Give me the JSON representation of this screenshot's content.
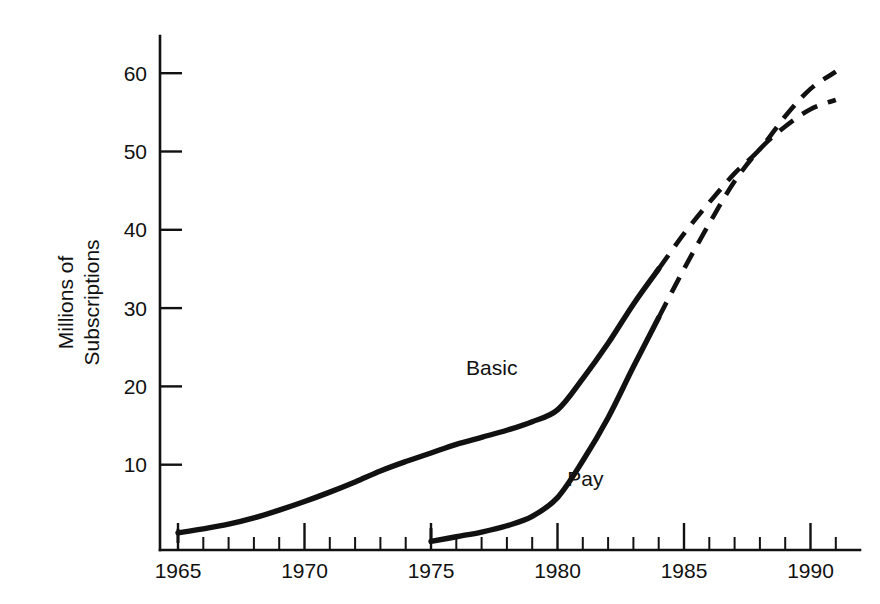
{
  "chart_data": {
    "type": "line",
    "title": "",
    "subtitle": "",
    "xlabel": "",
    "ylabel": "Millions of Subscriptions",
    "ylabel_lines": [
      "Millions of",
      "Subscriptions"
    ],
    "xlim": [
      1965,
      1991
    ],
    "ylim": [
      0,
      64
    ],
    "grid": false,
    "legend_position": "inline-annotations",
    "y_ticks": [
      10,
      20,
      30,
      40,
      50,
      60
    ],
    "y_tick_labels": [
      "10",
      "20",
      "30",
      "40",
      "50",
      "60"
    ],
    "x_ticks_major": [
      1965,
      1970,
      1975,
      1980,
      1985,
      1990
    ],
    "x_tick_labels": [
      "1965",
      "1970",
      "1975",
      "1980",
      "1985",
      "1990"
    ],
    "x_ticks_minor": [
      1966,
      1967,
      1968,
      1969,
      1971,
      1972,
      1973,
      1974,
      1976,
      1977,
      1978,
      1979,
      1981,
      1982,
      1983,
      1984,
      1986,
      1987,
      1988,
      1989,
      1991
    ],
    "series": [
      {
        "name": "Basic",
        "label": "Basic",
        "label_x": 1977.4,
        "label_y": 21.5,
        "style": "solid-then-dashed",
        "actual": [
          {
            "x": 1965,
            "y": 1.3
          },
          {
            "x": 1966,
            "y": 1.8
          },
          {
            "x": 1967,
            "y": 2.4
          },
          {
            "x": 1968,
            "y": 3.2
          },
          {
            "x": 1969,
            "y": 4.2
          },
          {
            "x": 1970,
            "y": 5.3
          },
          {
            "x": 1971,
            "y": 6.5
          },
          {
            "x": 1972,
            "y": 7.8
          },
          {
            "x": 1973,
            "y": 9.2
          },
          {
            "x": 1974,
            "y": 10.4
          },
          {
            "x": 1975,
            "y": 11.5
          },
          {
            "x": 1976,
            "y": 12.6
          },
          {
            "x": 1977,
            "y": 13.5
          },
          {
            "x": 1978,
            "y": 14.4
          },
          {
            "x": 1979,
            "y": 15.5
          },
          {
            "x": 1980,
            "y": 17.0
          },
          {
            "x": 1981,
            "y": 21.0
          },
          {
            "x": 1982,
            "y": 25.5
          },
          {
            "x": 1983,
            "y": 30.5
          },
          {
            "x": 1984,
            "y": 35.0
          }
        ],
        "projected": [
          {
            "x": 1984,
            "y": 35.0
          },
          {
            "x": 1985,
            "y": 39.5
          },
          {
            "x": 1986,
            "y": 43.5
          },
          {
            "x": 1987,
            "y": 47.2
          },
          {
            "x": 1988,
            "y": 50.3
          },
          {
            "x": 1989,
            "y": 54.5
          },
          {
            "x": 1990,
            "y": 58.0
          },
          {
            "x": 1991,
            "y": 60.2
          }
        ],
        "start_marker": {
          "x": 1965,
          "y0": 0,
          "y1": 1.8
        }
      },
      {
        "name": "Pay",
        "label": "Pay",
        "label_x": 1981.1,
        "label_y": 7.3,
        "style": "solid-then-dashed",
        "actual": [
          {
            "x": 1975,
            "y": 0.2
          },
          {
            "x": 1976,
            "y": 0.8
          },
          {
            "x": 1977,
            "y": 1.4
          },
          {
            "x": 1978,
            "y": 2.2
          },
          {
            "x": 1979,
            "y": 3.4
          },
          {
            "x": 1980,
            "y": 5.8
          },
          {
            "x": 1981,
            "y": 10.5
          },
          {
            "x": 1982,
            "y": 16.0
          },
          {
            "x": 1983,
            "y": 22.5
          },
          {
            "x": 1984,
            "y": 28.8
          }
        ],
        "projected": [
          {
            "x": 1984,
            "y": 28.8
          },
          {
            "x": 1985,
            "y": 35.0
          },
          {
            "x": 1986,
            "y": 40.8
          },
          {
            "x": 1987,
            "y": 46.2
          },
          {
            "x": 1988,
            "y": 50.3
          },
          {
            "x": 1989,
            "y": 53.2
          },
          {
            "x": 1990,
            "y": 55.4
          },
          {
            "x": 1991,
            "y": 56.6
          }
        ],
        "start_marker": {
          "x": 1975,
          "y0": 0,
          "y1": 1.9
        }
      }
    ],
    "annotations": [
      {
        "text": "Basic",
        "x": 1977.4,
        "y": 21.5
      },
      {
        "text": "Pay",
        "x": 1981.1,
        "y": 7.3
      }
    ]
  },
  "colors": {
    "ink": "#111111",
    "background": "#ffffff"
  }
}
